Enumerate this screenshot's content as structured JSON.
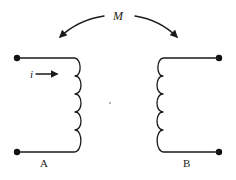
{
  "diagram": {
    "type": "mutual-inductance-coupled-coils",
    "mutual_label": "M",
    "current_label": "i",
    "coils": [
      {
        "id": "A",
        "label": "A",
        "turns": 5,
        "side": "left",
        "current_arrow": true
      },
      {
        "id": "B",
        "label": "B",
        "turns": 5,
        "side": "right",
        "current_arrow": false
      }
    ],
    "colors": {
      "line": "#1a1a1a",
      "background": "#ffffff"
    }
  }
}
